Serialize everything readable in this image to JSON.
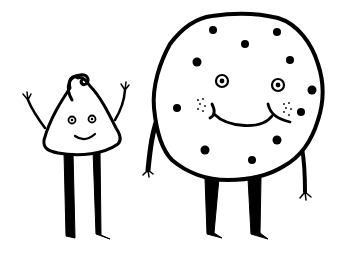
{
  "illustration": {
    "description": "Hand-drawn black ink cartoon of a chocolate chip and a chocolate chip cookie standing side by side, smiling",
    "colors": {
      "ink": "#000000",
      "background": "#ffffff"
    },
    "characters": [
      {
        "name": "chocolate-chip",
        "pose": "arms raised",
        "expression": "smile"
      },
      {
        "name": "cookie",
        "pose": "arms down",
        "expression": "big smile with freckles"
      }
    ]
  }
}
